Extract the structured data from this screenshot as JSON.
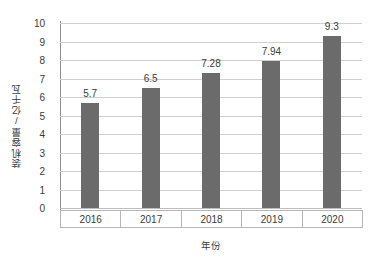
{
  "chart_data": {
    "type": "bar",
    "title": "",
    "subtitle": "",
    "xlabel": "年份",
    "ylabel": "装机容量/亿千瓦",
    "categories": [
      "2016",
      "2017",
      "2018",
      "2019",
      "2020"
    ],
    "values": [
      5.7,
      6.5,
      7.28,
      7.94,
      9.3
    ],
    "value_labels": [
      "5.7",
      "6.5",
      "7.28",
      "7.94",
      "9.3"
    ],
    "series": [
      {
        "name": "装机容量",
        "values": [
          5.7,
          6.5,
          7.28,
          7.94,
          9.3
        ]
      }
    ],
    "ylim": [
      0,
      10
    ],
    "ytick_step": 1,
    "ytick_labels": [
      "10",
      "9",
      "8",
      "7",
      "6",
      "5",
      "4",
      "3",
      "2",
      "1",
      "0"
    ],
    "ytick_values": [
      10,
      9,
      8,
      7,
      6,
      5,
      4,
      3,
      2,
      1,
      0
    ],
    "grid": "horizontal",
    "legend": "none",
    "bar_color": "#6b6b6b",
    "gridline_color": "#cfcfcf",
    "axis_color": "#8f8f8f",
    "background_color": "#ffffff",
    "text_color": "#3b3b3b"
  }
}
